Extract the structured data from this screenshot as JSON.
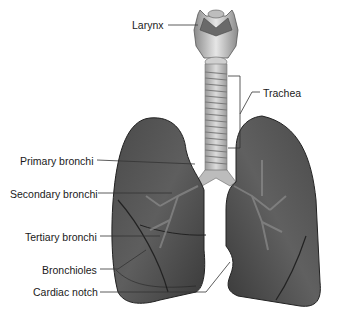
{
  "diagram": {
    "type": "anatomical-illustration",
    "labels": {
      "larynx": "Larynx",
      "trachea": "Trachea",
      "primary_bronchi": "Primary bronchi",
      "secondary_bronchi": "Secondary bronchi",
      "tertiary_bronchi": "Tertiary bronchi",
      "bronchioles": "Bronchioles",
      "cardiac_notch": "Cardiac notch"
    },
    "colors": {
      "background": "#ffffff",
      "lung_dark": "#2e2e2e",
      "lung_mid": "#5a5a5a",
      "lung_light": "#7a7a7a",
      "trachea": "#c8c8c8",
      "leader_line": "#333333",
      "text": "#1a1a1a"
    }
  }
}
